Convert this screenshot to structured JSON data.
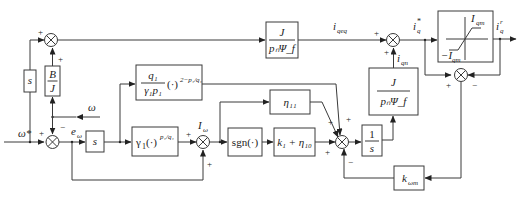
{
  "diagram": {
    "type": "control-block-diagram",
    "inputs": {
      "omega_ref": "ω*",
      "omega_fb": "ω"
    },
    "signals": {
      "e_omega": "e",
      "e_omega_sub": "ω",
      "I_omega": "I",
      "I_omega_sub": "ω",
      "i_qeq": "i",
      "i_qeq_sub": "qeq",
      "i_qn": "i",
      "i_qn_sub": "qn",
      "iq_star": "i",
      "iq_star_sub": "q",
      "iq_star_sup": "*",
      "iq_out": "i",
      "iq_out_sub": "q",
      "iq_out_sup": "r"
    },
    "blocks": {
      "s_left": "s",
      "B_over_J_num": "B",
      "B_over_J_den": "J",
      "s_deriv": "s",
      "gamma1_main": "γ",
      "gamma1_sub": "1",
      "gamma1_arg": "(·)",
      "gamma1_exp": "p₁/q₁",
      "q1_num": "q₁",
      "q1_den": "γ₁p₁",
      "q1_arg": "(·)",
      "q1_exp": "2−p₁/q₁",
      "sgn": "sgn(·)",
      "k1_eta10": "k₁ + η₁₀",
      "eta11": "η₁₁",
      "integrator_num": "1",
      "integrator_den": "s",
      "J_over_pnPsi_num": "J",
      "J_over_pnPsi_den": "pₙΨ_f",
      "J_over_pnPsi_low_num": "J",
      "J_over_pnPsi_low_den": "pₙΨ_f",
      "k_omega_m": "k",
      "k_omega_m_sub": "ωm",
      "sat_upper": "I",
      "sat_upper_sub": "qm",
      "sat_lower": "−I",
      "sat_lower_sub": "qm"
    },
    "signs": {
      "top_sum_left": "+",
      "top_sum_bottom": "+",
      "main_sum_left": "+",
      "main_sum_top": "−",
      "iomega_left": "+",
      "iomega_bottom": "+",
      "big_sum_eta11": "+",
      "big_sum_top": "+",
      "big_sum_left": "+",
      "big_sum_bottom": "−",
      "iq_sum_left": "+",
      "iq_sum_bottom": "+",
      "sat_sum_left": "+",
      "sat_sum_right": "−"
    }
  }
}
